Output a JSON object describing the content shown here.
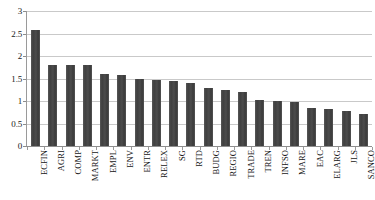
{
  "chart_data": {
    "type": "bar",
    "title": "",
    "subtitle": "",
    "xlabel": "",
    "ylabel": "",
    "ylim": [
      0,
      3
    ],
    "ytick_labels": [
      "3",
      "2.5",
      "2",
      "1.5",
      "1",
      "0.5",
      "0"
    ],
    "ytick_values": [
      3,
      2.5,
      2,
      1.5,
      1,
      0.5,
      0
    ],
    "grid": true,
    "legend": null,
    "legend_position": "none",
    "bar_color": "#4a4a4a",
    "gridline_color": "#c9c9c9",
    "axis_color": "#9a9a9a",
    "background_color": "#ffffff",
    "categories": [
      "ECFIN",
      "AGRI",
      "COMP",
      "MARKT",
      "EMPL",
      "ENV",
      "ENTR",
      "RELEX",
      "SG",
      "RTD",
      "BUDG",
      "REGIO",
      "TRADE",
      "TREN",
      "INFSO",
      "MARE",
      "EAC",
      "ELARG",
      "JLS",
      "SANCO"
    ],
    "values": [
      2.58,
      1.8,
      1.79,
      1.79,
      1.6,
      1.57,
      1.5,
      1.47,
      1.44,
      1.4,
      1.28,
      1.25,
      1.21,
      1.02,
      0.99,
      0.98,
      0.85,
      0.82,
      0.78,
      0.72
    ]
  }
}
